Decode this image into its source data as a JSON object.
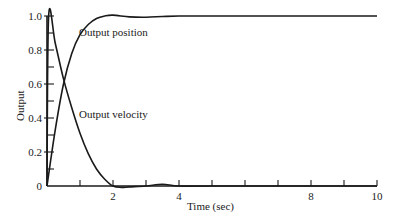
{
  "chart_data": {
    "type": "line",
    "title": "",
    "xlabel": "Time (sec)",
    "ylabel": "Output",
    "xlim": [
      0,
      10
    ],
    "ylim": [
      0,
      1.0
    ],
    "grid": false,
    "legend": "inline labels",
    "x_ticks": [
      0,
      1,
      2,
      3,
      4,
      5,
      6,
      7,
      8,
      9,
      10
    ],
    "x_tick_labels": [
      {
        "value": 2,
        "label": "2"
      },
      {
        "value": 4,
        "label": "4"
      },
      {
        "value": 8,
        "label": "8"
      },
      {
        "value": 10,
        "label": "10"
      }
    ],
    "y_ticks": [
      0,
      0.1,
      0.2,
      0.3,
      0.4,
      0.5,
      0.6,
      0.7,
      0.8,
      0.9,
      1.0
    ],
    "y_tick_labels": [
      {
        "value": 0,
        "label": "0"
      },
      {
        "value": 0.2,
        "label": "0.2"
      },
      {
        "value": 0.4,
        "label": "0.4"
      },
      {
        "value": 0.6,
        "label": "0.6"
      },
      {
        "value": 0.8,
        "label": "0.8"
      },
      {
        "value": 1.0,
        "label": "1.0"
      }
    ],
    "series": [
      {
        "name": "Output position",
        "label_position": {
          "x": 0.95,
          "y": 0.9
        },
        "x": [
          0,
          0.25,
          0.5,
          0.75,
          1.0,
          1.25,
          1.5,
          1.75,
          2.0,
          2.5,
          3.0,
          3.5,
          4.0,
          5,
          6,
          7,
          8,
          9,
          10
        ],
        "values": [
          0,
          0.33,
          0.6,
          0.78,
          0.89,
          0.95,
          0.985,
          1.0,
          1.005,
          0.995,
          0.993,
          0.997,
          1.0,
          1.0,
          1.0,
          1.0,
          1.0,
          1.0,
          1.0
        ]
      },
      {
        "name": "Output velocity",
        "label_position": {
          "x": 0.95,
          "y": 0.4
        },
        "x": [
          0,
          0.05,
          0.25,
          0.5,
          0.75,
          1.0,
          1.25,
          1.5,
          1.75,
          2.0,
          2.25,
          2.5,
          3.0,
          3.5,
          4.0,
          5,
          10
        ],
        "values": [
          0,
          1.0,
          0.84,
          0.63,
          0.46,
          0.31,
          0.19,
          0.1,
          0.04,
          0.0,
          -0.008,
          -0.005,
          0.0,
          0.01,
          0.0,
          0.0,
          0.0
        ]
      }
    ]
  },
  "labels": {
    "xlabel": "Time (sec)",
    "ylabel": "Output",
    "series_position": "Output position",
    "series_velocity": "Output velocity"
  }
}
